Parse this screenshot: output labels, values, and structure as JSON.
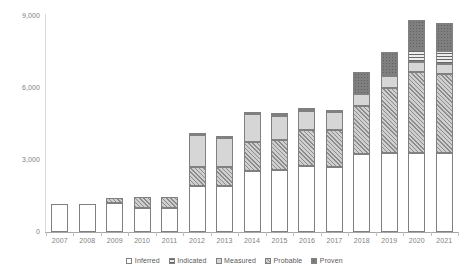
{
  "chart_data": {
    "type": "bar",
    "stacked": true,
    "title": "",
    "xlabel": "",
    "ylabel": "",
    "ylim": [
      0,
      9000
    ],
    "yticks": [
      0,
      3000,
      6000,
      9000
    ],
    "ytick_labels": [
      "0",
      "3,000",
      "6,000",
      "9,000"
    ],
    "grid": false,
    "legend_position": "bottom",
    "categories": [
      "2007",
      "2008",
      "2009",
      "2010",
      "2011",
      "2012",
      "2013",
      "2014",
      "2015",
      "2016",
      "2017",
      "2018",
      "2019",
      "2020",
      "2021"
    ],
    "series": [
      {
        "name": "Inferred",
        "pattern": "white",
        "values": [
          1150,
          1150,
          1220,
          1000,
          1000,
          1900,
          1900,
          2550,
          2600,
          2750,
          2700,
          3250,
          3300,
          3300,
          3300
        ]
      },
      {
        "name": "Probable",
        "pattern": "diagonal-hatch",
        "values": [
          0,
          0,
          180,
          450,
          460,
          800,
          820,
          1200,
          1250,
          1500,
          1550,
          2000,
          2700,
          3350,
          3300
        ]
      },
      {
        "name": "Measured",
        "pattern": "solid-light-gray",
        "values": [
          0,
          0,
          0,
          0,
          0,
          1350,
          1200,
          1150,
          1000,
          800,
          750,
          500,
          480,
          420,
          420
        ]
      },
      {
        "name": "Indicated",
        "pattern": "horizontal-lines",
        "values": [
          0,
          0,
          0,
          0,
          0,
          0,
          0,
          0,
          0,
          0,
          0,
          0,
          0,
          520,
          520
        ]
      },
      {
        "name": "Proven",
        "pattern": "dark-dotted-gray",
        "values": [
          0,
          0,
          0,
          0,
          0,
          80,
          80,
          100,
          100,
          100,
          100,
          900,
          1000,
          1250,
          1150
        ]
      }
    ],
    "totals": [
      1150,
      1150,
      1400,
      1450,
      1460,
      4130,
      4000,
      5000,
      4950,
      5150,
      5100,
      6650,
      7480,
      8840,
      8690
    ]
  },
  "legend": {
    "items": [
      {
        "label": "Inferred",
        "swatch": "legend-swatch-inferred"
      },
      {
        "label": "Indicated",
        "swatch": "legend-swatch-indicated"
      },
      {
        "label": "Measured",
        "swatch": "legend-swatch-measured"
      },
      {
        "label": "Probable",
        "swatch": "legend-swatch-probable"
      },
      {
        "label": "Proven",
        "swatch": "legend-swatch-proven"
      }
    ]
  }
}
